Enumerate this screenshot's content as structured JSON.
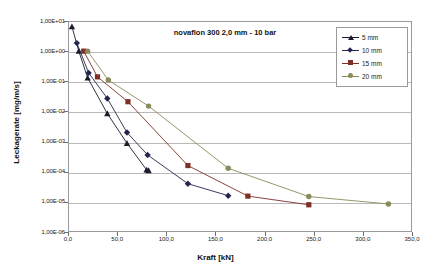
{
  "chart_data": {
    "type": "line",
    "title": "novaflon 300 2,0 mm  -  10 bar",
    "xlabel": "Kraft  [kN]",
    "ylabel": "Leckagerate [mg/m/s]",
    "xlim": [
      0,
      350
    ],
    "ylim": [
      1e-06,
      10.0
    ],
    "yscale": "log",
    "xticks": [
      0,
      50,
      100,
      150,
      200,
      250,
      300,
      350
    ],
    "xticklabels": [
      "0,0",
      "50,0",
      "100,0",
      "150,0",
      "200,0",
      "250,0",
      "300,0",
      "350,0"
    ],
    "yticks": [
      1e-06,
      1e-05,
      0.0001,
      0.001,
      0.01,
      0.1,
      1,
      10
    ],
    "yticklabels": [
      "1,00E-06",
      "1,00E-05",
      "1,00E-04",
      "1,00E-03",
      "1,00E-02",
      "1,00E-01",
      "1,00E+00",
      "1,00E+01"
    ],
    "grid": "horizontal",
    "legend_position": "top-right",
    "series": [
      {
        "name": "5 mm",
        "color": "#1b1b2e",
        "marker": "triangle",
        "x": [
          4,
          11,
          20,
          40,
          60,
          80,
          82
        ],
        "y": [
          6.5,
          1.0,
          0.13,
          0.0085,
          0.00088,
          0.000115,
          0.00011
        ]
      },
      {
        "name": "10 mm",
        "color": "#252552",
        "marker": "diamond",
        "x": [
          9,
          21,
          40,
          60,
          81,
          122,
          163
        ],
        "y": [
          1.85,
          0.19,
          0.027,
          0.002,
          0.00036,
          4e-05,
          1.6e-05
        ]
      },
      {
        "name": "15 mm",
        "color": "#7e2f26",
        "marker": "square",
        "x": [
          16,
          30,
          61,
          122,
          183,
          245
        ],
        "y": [
          1.0,
          0.14,
          0.021,
          0.00016,
          1.55e-05,
          8e-06
        ]
      },
      {
        "name": "20 mm",
        "color": "#8a8a5c",
        "marker": "circle",
        "x": [
          20,
          41,
          82,
          163,
          245,
          326
        ],
        "y": [
          1.0,
          0.11,
          0.015,
          0.00013,
          1.5e-05,
          8.5e-06
        ]
      }
    ]
  },
  "legend": {
    "items": [
      {
        "label": "5 mm"
      },
      {
        "label": "10 mm"
      },
      {
        "label": "15 mm"
      },
      {
        "label": "20 mm"
      }
    ]
  }
}
